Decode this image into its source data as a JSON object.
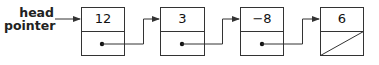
{
  "diagram": {
    "type": "singly-linked-list",
    "head_label_line1": "head",
    "head_label_line2": "pointer",
    "nodes": [
      {
        "value": "12",
        "next": "pointer"
      },
      {
        "value": "3",
        "next": "pointer"
      },
      {
        "value": "−8",
        "next": "pointer"
      },
      {
        "value": "6",
        "next": "null"
      }
    ],
    "colors": {
      "stroke": "#333333",
      "text": "#111111",
      "background": "#ffffff"
    }
  }
}
